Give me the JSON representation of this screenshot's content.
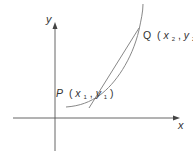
{
  "diagram": {
    "type": "secant-line-on-curve",
    "axes": {
      "x_label": "x",
      "y_label": "y"
    },
    "points": [
      {
        "name": "P",
        "coord_x": "x",
        "coord_x_sub": "1",
        "coord_y": "y",
        "coord_y_sub": "1",
        "open": "(",
        "comma": ",",
        "close": ")"
      },
      {
        "name": "Q",
        "coord_x": "x",
        "coord_x_sub": "2",
        "coord_y": "y",
        "coord_y_sub": "2",
        "open": "(",
        "comma": ",",
        "close": ")"
      }
    ],
    "colors": {
      "axis": "#555555",
      "curve": "#888888",
      "secant": "#888888",
      "text": "#333333"
    }
  }
}
